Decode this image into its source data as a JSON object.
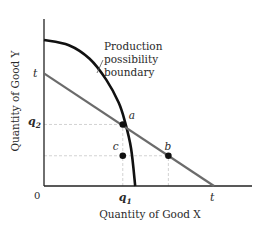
{
  "chart_data": {
    "type": "line",
    "title": "",
    "xlabel": "Quantity of Good X",
    "ylabel": "Quantity of Good Y",
    "origin_label": "0",
    "xlim": [
      0,
      10
    ],
    "ylim": [
      0,
      8
    ],
    "grid": false,
    "x_tick_labels": [
      {
        "label": "q",
        "sub": "1",
        "x": 3.8
      },
      {
        "label": "t",
        "x": 8.2
      }
    ],
    "y_tick_labels": [
      {
        "label": "q",
        "sub": "2",
        "y": 3.1
      },
      {
        "label": "t",
        "y": 5.4
      }
    ],
    "series": [
      {
        "name": "Production possibility boundary",
        "kind": "curve",
        "color": "#111111",
        "points": [
          [
            0,
            7.0
          ],
          [
            1.2,
            6.75
          ],
          [
            2.2,
            6.1
          ],
          [
            3.0,
            5.1
          ],
          [
            3.6,
            4.0
          ],
          [
            3.9,
            3.1
          ],
          [
            4.2,
            1.8
          ],
          [
            4.4,
            0
          ]
        ]
      },
      {
        "name": "t line",
        "kind": "line",
        "color": "#6b6b6b",
        "points": [
          [
            0,
            5.4
          ],
          [
            8.2,
            0
          ]
        ]
      }
    ],
    "points": [
      {
        "label": "a",
        "x": 3.8,
        "y": 2.95
      },
      {
        "label": "b",
        "x": 6.0,
        "y": 1.45
      },
      {
        "label": "c",
        "x": 3.8,
        "y": 1.45
      }
    ],
    "guides": [
      {
        "from": [
          0,
          2.95
        ],
        "to": [
          3.8,
          2.95
        ]
      },
      {
        "from": [
          3.8,
          0
        ],
        "to": [
          3.8,
          2.95
        ]
      },
      {
        "from": [
          0,
          1.45
        ],
        "to": [
          6.0,
          1.45
        ]
      },
      {
        "from": [
          6.0,
          0
        ],
        "to": [
          6.0,
          1.45
        ]
      }
    ],
    "annotations": [
      {
        "text_lines": [
          "Production",
          "possibility",
          "boundary"
        ],
        "points_to": "Production possibility boundary"
      }
    ]
  }
}
